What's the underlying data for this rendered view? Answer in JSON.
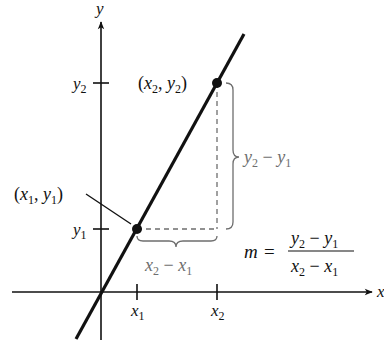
{
  "diagram": {
    "axes": {
      "x_label": "x",
      "y_label": "y"
    },
    "ticks": {
      "x1": "x",
      "x1_sub": "1",
      "x2": "x",
      "x2_sub": "2",
      "y1": "y",
      "y1_sub": "1",
      "y2": "y",
      "y2_sub": "2"
    },
    "points": [
      {
        "label_open": "(",
        "xv": "x",
        "xs": "1",
        "comma": ", ",
        "yv": "y",
        "ys": "1",
        "label_close": ")"
      },
      {
        "label_open": "(",
        "xv": "x",
        "xs": "2",
        "comma": ", ",
        "yv": "y",
        "ys": "2",
        "label_close": ")"
      }
    ],
    "rise_label": {
      "a": "y",
      "a_sub": "2",
      "minus": " − ",
      "b": "y",
      "b_sub": "1"
    },
    "run_label": {
      "a": "x",
      "a_sub": "2",
      "minus": " − ",
      "b": "x",
      "b_sub": "1"
    },
    "formula": {
      "lhs": "m",
      "equals": "=",
      "numerator": {
        "a": "y",
        "a_sub": "2",
        "minus": " − ",
        "b": "y",
        "b_sub": "1"
      },
      "denominator": {
        "a": "x",
        "a_sub": "2",
        "minus": " − ",
        "b": "x",
        "b_sub": "1"
      }
    },
    "colors": {
      "ink": "#111111",
      "gray": "#6e6e6e"
    }
  }
}
